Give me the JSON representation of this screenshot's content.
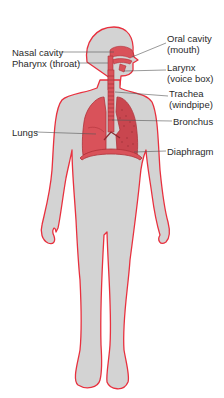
{
  "diagram": {
    "colors": {
      "body_fill": "#d3d3d3",
      "body_outline": "#e8303e",
      "organ_fill": "#d9525a",
      "organ_dark": "#b0323a",
      "leader_line": "#555555",
      "label_text": "#2a2a2a"
    },
    "labels": {
      "nasal_cavity": "Nasal cavity",
      "pharynx": "Pharynx (throat)",
      "oral_cavity_1": "Oral cavity",
      "oral_cavity_2": "(mouth)",
      "larynx_1": "Larynx",
      "larynx_2": "(voice box)",
      "trachea_1": "Trachea",
      "trachea_2": "(windpipe)",
      "bronchus": "Bronchus",
      "lungs": "Lungs",
      "diaphragm": "Diaphragm"
    }
  }
}
